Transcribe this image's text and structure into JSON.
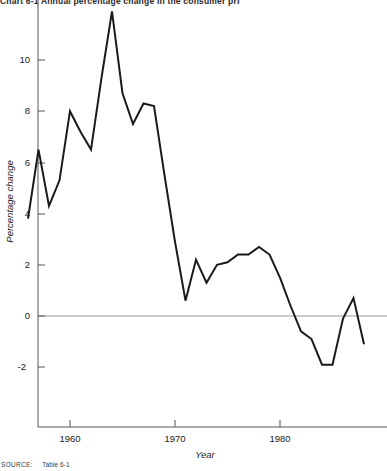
{
  "title": "Chart 6-1    Annual percentage change in the consumer price index, 1956-1988",
  "source": {
    "label": "SOURCE:",
    "value": "Table 6-1"
  },
  "axes": {
    "y_title": "Percentage change",
    "x_title": "Year",
    "y_ticks": [
      10,
      8,
      6,
      4,
      2,
      0,
      -2
    ],
    "y_tick_labels": [
      "10",
      "8",
      "6",
      "4",
      "2",
      "0",
      "-2"
    ],
    "x_ticks": [
      1960,
      1970,
      1980
    ],
    "x_tick_labels": [
      "1960",
      "1970",
      "1980"
    ]
  },
  "colors": {
    "line": "#1a1a1a",
    "axis": "#555555",
    "zero_line": "#9a9a9a",
    "background": "#ffffff"
  },
  "chart_data": {
    "type": "line",
    "title": "Chart 6-1    Annual percentage change in the consumer price index, 1956-1988",
    "xlabel": "Year",
    "ylabel": "Percentage change",
    "xlim": [
      1956,
      1988
    ],
    "ylim": [
      -3.2,
      12.3
    ],
    "grid": false,
    "legend": "none",
    "zero_reference_line": 0,
    "x": [
      1956,
      1957,
      1958,
      1959,
      1960,
      1961,
      1962,
      1963,
      1964,
      1965,
      1966,
      1967,
      1968,
      1969,
      1970,
      1971,
      1972,
      1973,
      1974,
      1975,
      1976,
      1977,
      1978,
      1979,
      1980,
      1981,
      1982,
      1983,
      1984,
      1985,
      1986,
      1987,
      1988
    ],
    "values": [
      3.8,
      6.5,
      4.3,
      5.3,
      8.0,
      7.2,
      6.5,
      9.3,
      11.9,
      8.7,
      7.5,
      8.3,
      8.2,
      5.5,
      2.9,
      0.6,
      2.2,
      1.3,
      2.0,
      2.1,
      2.4,
      2.4,
      2.7,
      2.4,
      1.5,
      0.4,
      -0.6,
      -0.9,
      -1.9,
      -1.9,
      -0.1,
      0.7,
      -1.1
    ],
    "series": [
      {
        "name": "Percentage change",
        "values": [
          3.8,
          6.5,
          4.3,
          5.3,
          8.0,
          7.2,
          6.5,
          9.3,
          11.9,
          8.7,
          7.5,
          8.3,
          8.2,
          5.5,
          2.9,
          0.6,
          2.2,
          1.3,
          2.0,
          2.1,
          2.4,
          2.4,
          2.7,
          2.4,
          1.5,
          0.4,
          -0.6,
          -0.9,
          -1.9,
          -1.9,
          -0.1,
          0.7,
          -1.1
        ]
      }
    ]
  }
}
